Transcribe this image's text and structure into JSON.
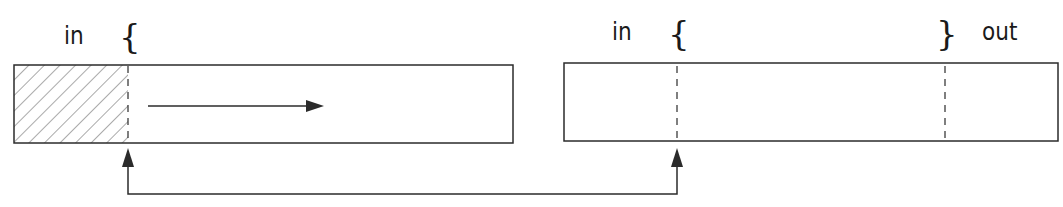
{
  "diagram": {
    "left_buffer": {
      "label_in": "in",
      "brace_open": "{",
      "hatched_region": "consumed",
      "flow_arrow": "right"
    },
    "right_buffer": {
      "label_in": "in",
      "brace_open": "{",
      "brace_close": "}",
      "label_out": "out"
    },
    "connector": {
      "description": "pointer relation between in-position of left buffer and in-position of right buffer",
      "direction": "bidirectional-up-arrows"
    },
    "colors": {
      "stroke": "#2b2b2b",
      "background": "#ffffff"
    }
  }
}
